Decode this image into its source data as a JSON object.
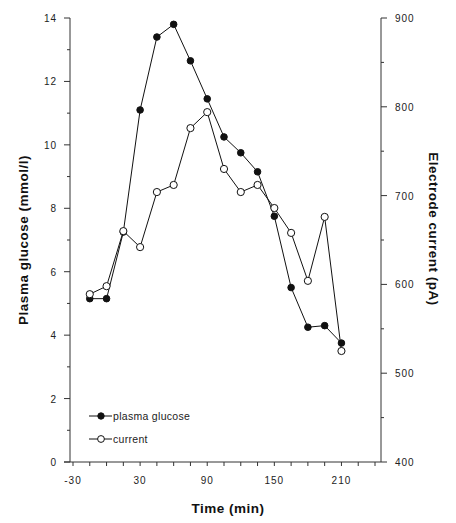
{
  "chart_data": {
    "type": "line",
    "title": "",
    "xlabel": "Time (min)",
    "ylabel": "Plasma glucose (mmol/l)",
    "y2label": "Electrode current (pA)",
    "xlim": [
      -30,
      240
    ],
    "ylim": [
      0,
      14
    ],
    "y2lim": [
      400,
      900
    ],
    "x_ticks": [
      -30,
      30,
      90,
      150,
      210
    ],
    "x_tick_labels": [
      "-30",
      "30",
      "90",
      "150",
      "210"
    ],
    "x_minor_step": 15,
    "y_ticks": [
      0,
      2,
      4,
      6,
      8,
      10,
      12,
      14
    ],
    "y_tick_labels": [
      "0",
      "2",
      "4",
      "6",
      "8",
      "10",
      "12",
      "14"
    ],
    "y_minor_step": 1,
    "y2_ticks": [
      400,
      500,
      600,
      700,
      800,
      900
    ],
    "y2_tick_labels": [
      "400",
      "500",
      "600",
      "700",
      "800",
      "900"
    ],
    "y2_minor_step": 50,
    "grid": false,
    "legend_position": "lower-left",
    "x": [
      -15,
      0,
      15,
      30,
      45,
      60,
      75,
      90,
      105,
      120,
      135,
      150,
      165,
      180,
      195,
      210
    ],
    "series": [
      {
        "name": "plasma glucose",
        "axis": "left",
        "marker": "filled-circle",
        "values": [
          5.15,
          5.15,
          7.25,
          11.1,
          13.4,
          13.8,
          12.65,
          11.45,
          10.25,
          9.75,
          9.15,
          7.75,
          5.5,
          4.25,
          4.3,
          3.75
        ]
      },
      {
        "name": "current",
        "axis": "right",
        "marker": "open-circle",
        "values": [
          589,
          598,
          660,
          642,
          704,
          712,
          776,
          794,
          730,
          704,
          712,
          686,
          658,
          604,
          676,
          525
        ]
      }
    ]
  },
  "legend": {
    "items": [
      {
        "label": "plasma glucose",
        "marker": "filled-circle"
      },
      {
        "label": "current",
        "marker": "open-circle"
      }
    ]
  },
  "axes": {
    "x_title": "Time  (min)",
    "y_left_title": "Plasma  glucose  (mmol/l)",
    "y_right_title": "Electrode  current  (pA)"
  },
  "colors": {
    "line": "#111111",
    "axis": "#333333",
    "background": "#ffffff"
  }
}
